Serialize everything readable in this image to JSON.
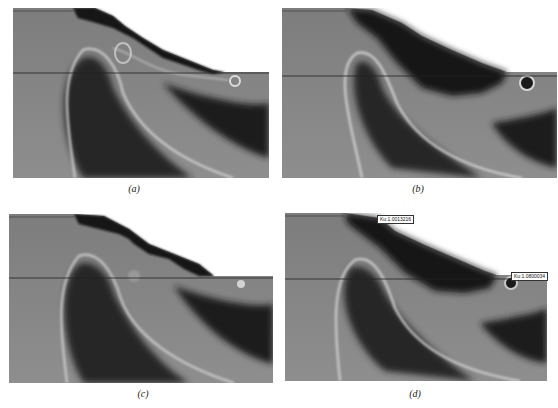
{
  "figure": {
    "panels": [
      {
        "id": "a",
        "caption": "(a)"
      },
      {
        "id": "b",
        "caption": "(b)"
      },
      {
        "id": "c",
        "caption": "(c)"
      },
      {
        "id": "d",
        "caption": "(d)",
        "annotations": [
          {
            "label": "Ku:1.0013216"
          },
          {
            "label": "Ku:1.0800034"
          }
        ]
      }
    ]
  }
}
